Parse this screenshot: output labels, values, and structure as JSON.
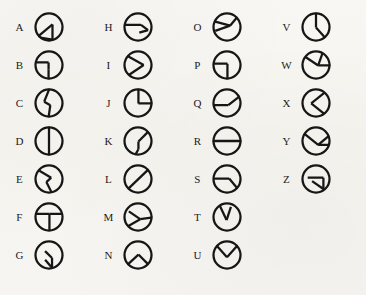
{
  "page": {
    "background_color": "#f7f6f2",
    "ink_color": "#161616",
    "glyph_count": 26,
    "columns": 4,
    "rows_per_column": [
      7,
      7,
      7,
      5
    ]
  },
  "cipher": {
    "columns": [
      {
        "index": 0,
        "entries": [
          {
            "letter": "A",
            "glyph": "circle-wedge-lower-left-apex-up",
            "paths": [
              [
                12,
                62,
                47,
                33
              ],
              [
                47,
                33,
                47,
                68
              ],
              [
                47,
                68,
                12,
                62
              ]
            ]
          },
          {
            "letter": "B",
            "glyph": "circle-step-lower-left-rect",
            "paths": [
              [
                6,
                33,
                38,
                33
              ],
              [
                38,
                33,
                38,
                50
              ],
              [
                38,
                50,
                38,
                72
              ]
            ]
          },
          {
            "letter": "C",
            "glyph": "circle-bent-line-vertical",
            "paths": [
              [
                40,
                6,
                28,
                36
              ],
              [
                28,
                36,
                42,
                44
              ],
              [
                42,
                44,
                38,
                72
              ]
            ]
          },
          {
            "letter": "D",
            "glyph": "circle-vertical-diameter",
            "paths": [
              [
                39,
                5,
                39,
                73
              ]
            ]
          },
          {
            "letter": "E",
            "glyph": "circle-diagonal-bend",
            "paths": [
              [
                17,
                20,
                44,
                36
              ],
              [
                44,
                36,
                33,
                46
              ],
              [
                33,
                46,
                45,
                70
              ]
            ]
          },
          {
            "letter": "F",
            "glyph": "circle-rect-lower-right",
            "paths": [
              [
                8,
                32,
                40,
                32
              ],
              [
                40,
                32,
                40,
                70
              ],
              [
                40,
                32,
                70,
                32
              ]
            ]
          },
          {
            "letter": "G",
            "glyph": "circle-small-arrow-center",
            "paths": [
              [
                30,
                30,
                46,
                46
              ],
              [
                46,
                46,
                46,
                68
              ],
              [
                46,
                68,
                30,
                50
              ]
            ]
          }
        ]
      },
      {
        "index": 1,
        "entries": [
          {
            "letter": "H",
            "glyph": "circle-line-left-to-center-triangle",
            "paths": [
              [
                6,
                34,
                46,
                34
              ],
              [
                46,
                34,
                62,
                46
              ],
              [
                62,
                46,
                42,
                52
              ]
            ]
          },
          {
            "letter": "I",
            "glyph": "circle-chevron-right",
            "paths": [
              [
                14,
                18,
                52,
                39
              ],
              [
                52,
                39,
                18,
                62
              ]
            ]
          },
          {
            "letter": "J",
            "glyph": "circle-quarter-upper-right",
            "paths": [
              [
                40,
                6,
                40,
                40
              ],
              [
                40,
                40,
                74,
                40
              ]
            ]
          },
          {
            "letter": "K",
            "glyph": "circle-diagonal-then-vertical",
            "paths": [
              [
                62,
                18,
                40,
                40
              ],
              [
                40,
                40,
                40,
                58
              ],
              [
                40,
                58,
                32,
                72
              ]
            ]
          },
          {
            "letter": "L",
            "glyph": "circle-full-diagonal",
            "paths": [
              [
                14,
                64,
                66,
                14
              ]
            ]
          },
          {
            "letter": "M",
            "glyph": "circle-wedge-lower-left",
            "paths": [
              [
                18,
                26,
                44,
                44
              ],
              [
                44,
                44,
                74,
                40
              ],
              [
                44,
                44,
                16,
                60
              ]
            ]
          },
          {
            "letter": "N",
            "glyph": "circle-peak-caret",
            "paths": [
              [
                12,
                64,
                40,
                38
              ],
              [
                40,
                38,
                66,
                64
              ]
            ]
          }
        ]
      },
      {
        "index": 2,
        "entries": [
          {
            "letter": "O",
            "glyph": "circle-wedge-upper-left",
            "paths": [
              [
                10,
                26,
                46,
                36
              ],
              [
                46,
                36,
                66,
                12
              ],
              [
                46,
                36,
                12,
                48
              ]
            ]
          },
          {
            "letter": "P",
            "glyph": "circle-quarter-lower-left",
            "paths": [
              [
                6,
                36,
                40,
                36
              ],
              [
                40,
                36,
                40,
                72
              ]
            ]
          },
          {
            "letter": "Q",
            "glyph": "circle-horizontal-with-diagonal",
            "paths": [
              [
                6,
                44,
                42,
                44
              ],
              [
                42,
                44,
                70,
                22
              ]
            ]
          },
          {
            "letter": "R",
            "glyph": "circle-horizontal-diameter",
            "paths": [
              [
                5,
                39,
                73,
                39
              ]
            ]
          },
          {
            "letter": "S",
            "glyph": "circle-horizontal-then-down-diagonal",
            "paths": [
              [
                8,
                38,
                44,
                38
              ],
              [
                44,
                38,
                64,
                62
              ]
            ]
          },
          {
            "letter": "T",
            "glyph": "circle-narrow-vee-top",
            "paths": [
              [
                22,
                12,
                38,
                46
              ],
              [
                38,
                46,
                48,
                16
              ]
            ]
          },
          {
            "letter": "U",
            "glyph": "circle-wide-vee-top",
            "paths": [
              [
                12,
                14,
                39,
                44
              ],
              [
                39,
                44,
                66,
                14
              ]
            ]
          }
        ]
      },
      {
        "index": 3,
        "entries": [
          {
            "letter": "V",
            "glyph": "circle-vertical-then-diagonal",
            "paths": [
              [
                39,
                5,
                39,
                40
              ],
              [
                39,
                40,
                62,
                66
              ]
            ]
          },
          {
            "letter": "W",
            "glyph": "circle-wedge-upper-right",
            "paths": [
              [
                14,
                20,
                44,
                40
              ],
              [
                44,
                40,
                74,
                40
              ],
              [
                44,
                40,
                54,
                12
              ]
            ]
          },
          {
            "letter": "X",
            "glyph": "circle-chevron-left",
            "paths": [
              [
                58,
                16,
                28,
                40
              ],
              [
                28,
                40,
                58,
                64
              ]
            ]
          },
          {
            "letter": "Y",
            "glyph": "circle-diagonal-and-horizontal-wedge",
            "paths": [
              [
                12,
                22,
                44,
                48
              ],
              [
                44,
                48,
                74,
                48
              ],
              [
                44,
                48,
                70,
                26
              ]
            ]
          },
          {
            "letter": "Z",
            "glyph": "circle-wedge-right-horizontal",
            "paths": [
              [
                20,
                36,
                56,
                36
              ],
              [
                56,
                36,
                56,
                62
              ],
              [
                56,
                62,
                30,
                44
              ]
            ]
          }
        ]
      }
    ]
  }
}
